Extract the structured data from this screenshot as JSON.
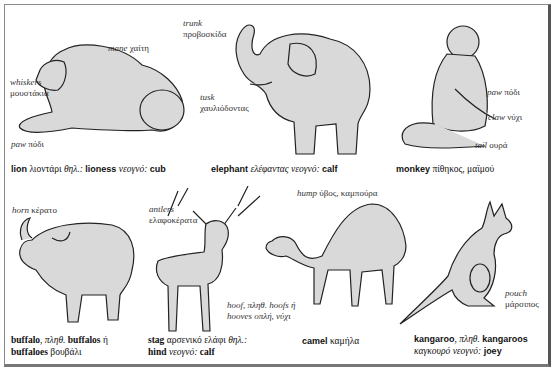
{
  "page": {
    "background": "#ffffff",
    "border_color": "#777777"
  },
  "animals": {
    "lion": {
      "labels": {
        "mane_en": "mane",
        "mane_gr": "χαίτη",
        "whiskers_en": "whiskers",
        "whiskers_gr": "μουστάκια",
        "paw_en": "paw",
        "paw_gr": "πόδι"
      },
      "caption": {
        "en": "lion",
        "gr": "λιοντάρι",
        "abbr": "θηλ.:",
        "female": "lioness",
        "young_label": "νεογνό:",
        "young": "cub"
      }
    },
    "elephant": {
      "labels": {
        "trunk_en": "trunk",
        "trunk_gr": "προβοσκίδα",
        "tusk_en": "tusk",
        "tusk_gr": "χαυλιόδοντας"
      },
      "caption": {
        "en": "elephant",
        "gr": "ελέφαντας",
        "young_label": "νεογνό:",
        "young": "calf"
      }
    },
    "monkey": {
      "labels": {
        "paw_en": "paw",
        "paw_gr": "πόδι",
        "claw_en": "claw",
        "claw_gr": "νύχι",
        "tail_en": "tail",
        "tail_gr": "ουρά"
      },
      "caption": {
        "en": "monkey",
        "gr": "πίθηκος, μαϊμού"
      }
    },
    "buffalo": {
      "labels": {
        "horn_en": "horn",
        "horn_gr": "κέρατο"
      },
      "caption": {
        "en": "buffalo",
        "comma": ",",
        "plural_label": "πληθ.",
        "plural1": "buffalos",
        "or": "ή",
        "plural2": "buffaloes",
        "gr": "βουβάλι"
      }
    },
    "stag": {
      "labels": {
        "antlers_en": "antlers",
        "antlers_gr": "ελαφοκέρατα"
      },
      "caption": {
        "en": "stag",
        "gr": "αρσενικό ελάφι",
        "abbr": "θηλ.:",
        "female": "hind",
        "young_label": "νεογνό:",
        "young": "calf"
      }
    },
    "camel": {
      "labels": {
        "hump_en": "hump",
        "hump_gr": "ύβος, καμπούρα",
        "hoof_line1": "hoof, πληθ. hoofs ή",
        "hoof_line2": "hooves οπλή, νύχι"
      },
      "caption": {
        "en": "camel",
        "gr": "καμήλα"
      }
    },
    "kangaroo": {
      "labels": {
        "pouch_en": "pouch",
        "pouch_gr": "μάρσιπος"
      },
      "caption": {
        "en": "kangaroo",
        "comma": ",",
        "plural_label": "πληθ.",
        "plural": "kangaroos",
        "gr": "καγκουρό",
        "young_label": "νεογνό:",
        "young": "joey"
      }
    }
  }
}
